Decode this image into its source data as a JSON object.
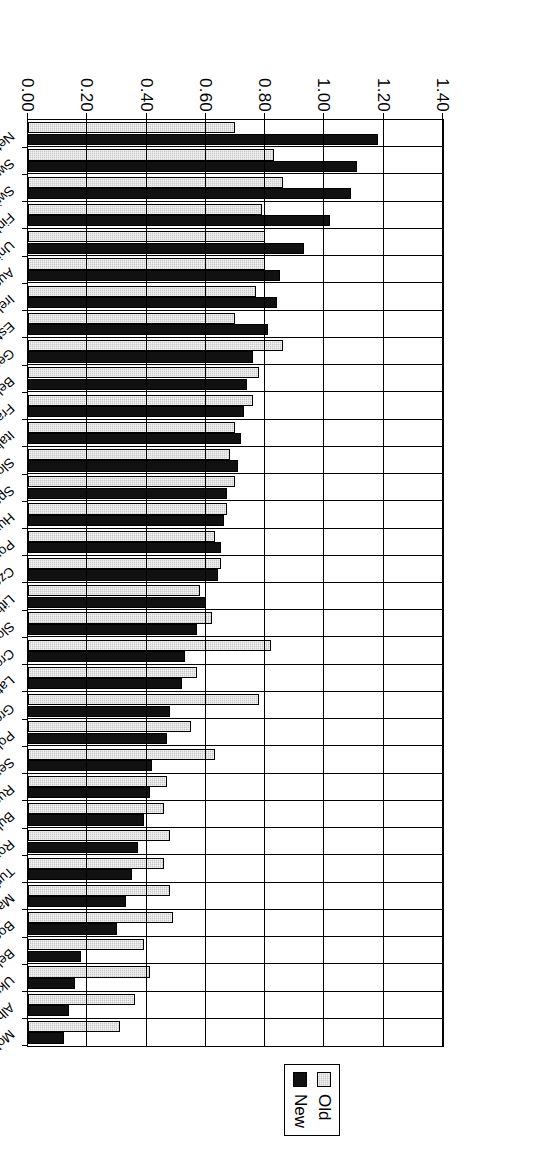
{
  "legend": {
    "position": "top-center",
    "entries": [
      {
        "label": "Old",
        "color": "#c9c9c9"
      },
      {
        "label": "New",
        "color": "#111111"
      }
    ]
  },
  "axis": {
    "tick_labels": [
      "0.00",
      "0.20",
      "0.40",
      "0.60",
      "0.80",
      "1.00",
      "1.20",
      "1.40"
    ]
  },
  "chart_data": {
    "type": "bar",
    "orientation": "horizontal",
    "title": "",
    "xlabel": "",
    "ylabel": "",
    "ylim": [
      0,
      1.4
    ],
    "yticks": [
      0.0,
      0.2,
      0.4,
      0.6,
      0.8,
      1.0,
      1.2,
      1.4
    ],
    "grid": true,
    "legend_position": "top-center",
    "categories": [
      "Netherlands",
      "Sweden",
      "Switzerland",
      "Finland",
      "United Kingdom",
      "Austria",
      "Ireland",
      "Estonia",
      "Germany",
      "Belgium",
      "France",
      "Italy",
      "Slovenia",
      "Spain",
      "Hungary",
      "Portugal",
      "Czech Republic",
      "Lithuania",
      "Slovak Republic",
      "Croatia",
      "Latvia",
      "Greece",
      "Poland",
      "Serbia",
      "Russian Federation",
      "Bulgaria",
      "Romania",
      "Turkey",
      "Macedonia, FYR",
      "Bosnia and Herzegovina",
      "Belarus",
      "Ukraine",
      "Albania",
      "Moldova"
    ],
    "series": [
      {
        "name": "Old",
        "color": "#c9c9c9",
        "values": [
          0.7,
          0.83,
          0.86,
          0.79,
          0.8,
          0.8,
          0.77,
          0.7,
          0.86,
          0.78,
          0.76,
          0.7,
          0.68,
          0.7,
          0.67,
          0.63,
          0.65,
          0.58,
          0.62,
          0.82,
          0.57,
          0.78,
          0.55,
          0.63,
          0.47,
          0.46,
          0.48,
          0.46,
          0.48,
          0.49,
          0.39,
          0.41,
          0.36,
          0.31
        ]
      },
      {
        "name": "New",
        "color": "#111111",
        "values": [
          1.18,
          1.11,
          1.09,
          1.02,
          0.93,
          0.85,
          0.84,
          0.81,
          0.76,
          0.74,
          0.73,
          0.72,
          0.71,
          0.67,
          0.66,
          0.65,
          0.64,
          0.6,
          0.57,
          0.53,
          0.52,
          0.48,
          0.47,
          0.42,
          0.41,
          0.39,
          0.37,
          0.35,
          0.33,
          0.3,
          0.18,
          0.16,
          0.14,
          0.12
        ]
      }
    ]
  }
}
